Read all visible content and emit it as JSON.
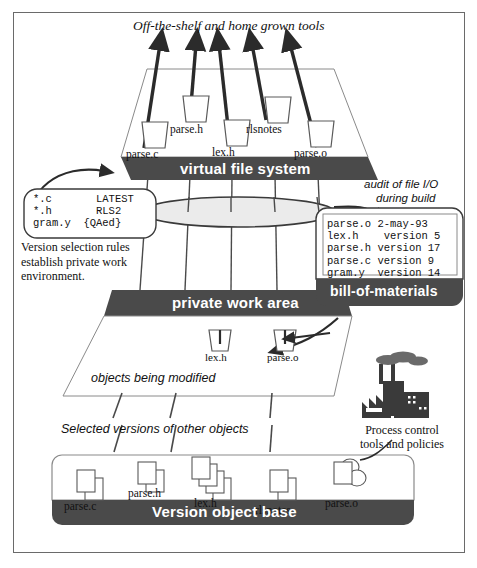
{
  "figure": {
    "title_top": "Off-the-shelf and home grown tools",
    "caption_audit": "audit of file I/O",
    "caption_audit2": "during build",
    "caption_objects_modified": "objects being modified",
    "caption_selected_versions": "Selected versions of other objects"
  },
  "banners": {
    "virtual_file_system": "virtual file system",
    "private_work_area": "private work area",
    "bill_of_materials": "bill-of-materials",
    "version_object_base": "Version object base"
  },
  "vfs_files": [
    {
      "name": "parse.c"
    },
    {
      "name": "parse.h"
    },
    {
      "name": "lex.h"
    },
    {
      "name": "rlsnotes"
    },
    {
      "name": "parse.o"
    }
  ],
  "work_area_files": [
    {
      "name": "lex.h"
    },
    {
      "name": "parse.o"
    }
  ],
  "vob_files": [
    {
      "name": "parse.c"
    },
    {
      "name": "parse.h"
    },
    {
      "name": "lex.h"
    },
    {
      "name": "rlsnotes"
    },
    {
      "name": "parse.o"
    }
  ],
  "config_spec": {
    "lines": [
      {
        "pattern": "*.c",
        "rule": "LATEST"
      },
      {
        "pattern": "*.h",
        "rule": "RLS2"
      },
      {
        "pattern": "gram.y",
        "rule": "{QAed}"
      }
    ],
    "text": "*.c       LATEST\n*.h       RLS2\ngram.y  {QAed}",
    "caption": "Version selection rules establish private work environment."
  },
  "bom": {
    "rows": [
      {
        "file": "parse.o",
        "version": "2-may-93"
      },
      {
        "file": "lex.h",
        "version": "version 5"
      },
      {
        "file": "parse.h",
        "version": "version 17"
      },
      {
        "file": "parse.c",
        "version": "version 9"
      },
      {
        "file": "gram.y",
        "version": "version 14"
      }
    ],
    "text": "parse.o 2-may-93\nlex.h    version 5\nparse.h version 17\nparse.c version 9\ngram.y  version 14"
  },
  "process_control": {
    "line1": "Process control",
    "line2": "tools and policies",
    "icon": "factory-icon"
  },
  "colors": {
    "banner_fill": "#4a4a4a",
    "banner_text": "#ffffff",
    "plane_stroke": "#8a8a8a",
    "arrow_fill": "#2b2b2b",
    "ellipse_fill": "#ebebeb",
    "frame_stroke": "#6a6a6a",
    "icon_stroke": "#5a5a5a"
  }
}
